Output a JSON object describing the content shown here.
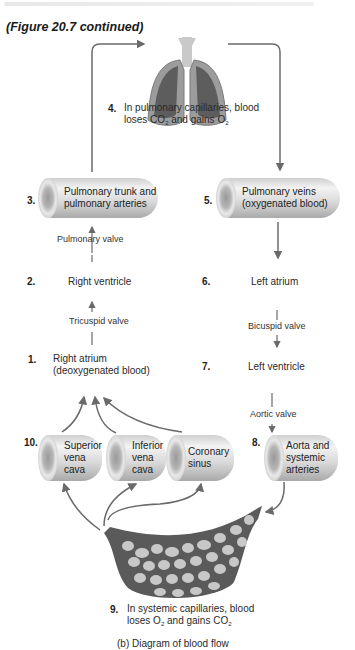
{
  "figure_caption": "(Figure 20.7 continued)",
  "steps": [
    {
      "num": "1.",
      "label_line1": "Right atrium",
      "label_line2": "(deoxygenated blood)"
    },
    {
      "num": "2.",
      "label": "Right ventricle"
    },
    {
      "num": "3.",
      "label_line1": "Pulmonary trunk and",
      "label_line2": "pulmonary arteries"
    },
    {
      "num": "4.",
      "label_line1": "In pulmonary capillaries, blood",
      "label_line2_pre": "loses CO",
      "label_line2_sub1": "2",
      "label_line2_mid": " and gains O",
      "label_line2_sub2": "2"
    },
    {
      "num": "5.",
      "label_line1": "Pulmonary veins",
      "label_line2": "(oxygenated blood)"
    },
    {
      "num": "6.",
      "label": "Left atrium"
    },
    {
      "num": "7.",
      "label": "Left ventricle"
    },
    {
      "num": "8.",
      "label_line1": "Aorta and",
      "label_line2": "systemic",
      "label_line3": "arteries"
    },
    {
      "num": "9.",
      "label_line1": "In systemic capillaries, blood",
      "label_line2_pre": "loses O",
      "label_line2_sub1": "2",
      "label_line2_mid": " and gains CO",
      "label_line2_sub2": "2"
    },
    {
      "num": "10.",
      "veins": [
        {
          "line1": "Superior",
          "line2": "vena",
          "line3": "cava"
        },
        {
          "line1": "Inferior",
          "line2": "vena",
          "line3": "cava"
        },
        {
          "line1": "Coronary",
          "line2": "sinus"
        }
      ]
    }
  ],
  "valves": {
    "pulmonary": "Pulmonary valve",
    "tricuspid": "Tricuspid valve",
    "bicuspid": "Bicuspid valve",
    "aortic": "Aortic valve"
  },
  "panel_caption": "(b) Diagram of blood flow",
  "colors": {
    "arrow": "#6a6a6a",
    "capillary_bed": "#5a5a5a",
    "cells": "#c8c8c8",
    "lung": "#9c9c9c"
  }
}
